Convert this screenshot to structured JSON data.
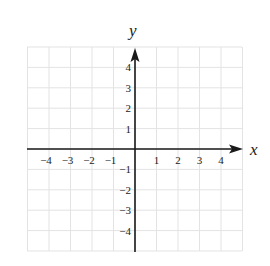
{
  "chart_data": {
    "type": "scatter",
    "title": "",
    "xlabel": "x",
    "ylabel": "y",
    "xlim": [
      -5,
      5
    ],
    "ylim": [
      -5,
      5
    ],
    "grid": true,
    "x_ticks": [
      -4,
      -3,
      -2,
      -1,
      1,
      2,
      3,
      4
    ],
    "y_ticks": [
      4,
      3,
      2,
      1,
      -1,
      -2,
      -3,
      -4
    ],
    "x_tick_labels": [
      "−4",
      "−3",
      "−2",
      "−1",
      "1",
      "2",
      "3",
      "4"
    ],
    "y_tick_labels": [
      "4",
      "3",
      "2",
      "1",
      "−1",
      "−2",
      "−3",
      "−4"
    ],
    "series": [],
    "legend": null
  },
  "colors": {
    "grid": "#e3e3e3",
    "axis": "#1a1a1a",
    "text": "#222222",
    "background": "#ffffff"
  }
}
